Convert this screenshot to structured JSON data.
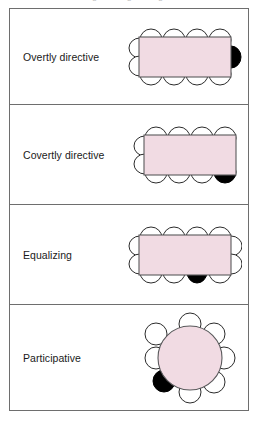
{
  "figure": {
    "title_remnant": "Meeting seating arrangements",
    "colors": {
      "table_fill": "#f1dbe3",
      "table_stroke": "#59595b",
      "chair_fill": "#ffffff",
      "chair_stroke": "#2b2b2b",
      "leader_chair_fill": "#000000",
      "frame_stroke": "#6e6e6e",
      "text": "#1a1a1a",
      "page_background": "#ffffff"
    }
  },
  "panels": [
    {
      "label": "Overtly directive",
      "table_shape": "rectangle",
      "chairs": {
        "top": 4,
        "bottom": 4,
        "left": 2,
        "right": 1,
        "total": 11
      },
      "leader_seat": {
        "side": "right",
        "index": 1,
        "description": "head of table, short end"
      }
    },
    {
      "label": "Covertly directive",
      "table_shape": "rectangle",
      "chairs": {
        "top": 4,
        "bottom": 4,
        "left": 2,
        "right": 0,
        "total": 10
      },
      "leader_seat": {
        "side": "bottom",
        "index": 4,
        "description": "bottom row, far right corner"
      }
    },
    {
      "label": "Equalizing",
      "table_shape": "rectangle",
      "chairs": {
        "top": 4,
        "bottom": 4,
        "left": 2,
        "right": 2,
        "total": 12
      },
      "leader_seat": {
        "side": "bottom",
        "index": 3,
        "description": "bottom row, third seat"
      }
    },
    {
      "label": "Participative",
      "table_shape": "circle",
      "chairs": {
        "around": 8,
        "total": 8
      },
      "leader_seat": {
        "side": "around",
        "index": 6,
        "description": "lower-left of circle, indistinguishable position"
      }
    }
  ]
}
